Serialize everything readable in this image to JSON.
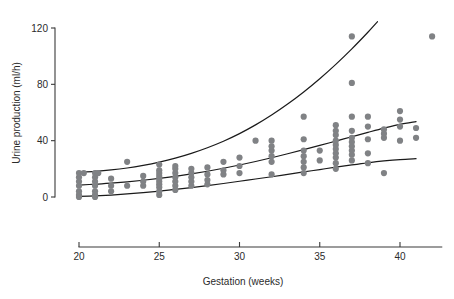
{
  "chart_data": {
    "type": "scatter",
    "title": "",
    "xlabel": "Gestation (weeks)",
    "ylabel": "Urine production (ml/h)",
    "xlim": [
      19.2,
      42.8
    ],
    "ylim": [
      -5,
      128
    ],
    "xticks": [
      20,
      25,
      30,
      35,
      40
    ],
    "xtick_labels": [
      "20",
      "25",
      "30",
      "35",
      "40"
    ],
    "yticks": [
      0,
      40,
      80,
      120
    ],
    "ytick_labels": [
      "0",
      "40",
      "80",
      "120"
    ],
    "grid": false,
    "legend": "none",
    "marker_color": "#808285",
    "curve_color": "#1a1a1a",
    "axis_color": "#3a3a3a",
    "series": [
      {
        "name": "Urine production measurements",
        "marker": "filled-circle",
        "points": [
          [
            20,
            0
          ],
          [
            20,
            1.5
          ],
          [
            20,
            4
          ],
          [
            20,
            8
          ],
          [
            20,
            11
          ],
          [
            20,
            14
          ],
          [
            20,
            17
          ],
          [
            20.3,
            17
          ],
          [
            21,
            0
          ],
          [
            21,
            1.5
          ],
          [
            21,
            4
          ],
          [
            21,
            8
          ],
          [
            21,
            11
          ],
          [
            21,
            14
          ],
          [
            21,
            17
          ],
          [
            21.2,
            17
          ],
          [
            22,
            4
          ],
          [
            22,
            8
          ],
          [
            22,
            13
          ],
          [
            23,
            8
          ],
          [
            23,
            25
          ],
          [
            24,
            8
          ],
          [
            24,
            11
          ],
          [
            24,
            15
          ],
          [
            25,
            1.5
          ],
          [
            25,
            4
          ],
          [
            25,
            7
          ],
          [
            25,
            9
          ],
          [
            25,
            11
          ],
          [
            25,
            13
          ],
          [
            25,
            15
          ],
          [
            25,
            17
          ],
          [
            25,
            19
          ],
          [
            25,
            23
          ],
          [
            26,
            5
          ],
          [
            26,
            8
          ],
          [
            26,
            11
          ],
          [
            26,
            14
          ],
          [
            26,
            17
          ],
          [
            26,
            20
          ],
          [
            26,
            22
          ],
          [
            27,
            8
          ],
          [
            27,
            11
          ],
          [
            27,
            14
          ],
          [
            27,
            17
          ],
          [
            27,
            20
          ],
          [
            28,
            9
          ],
          [
            28,
            12
          ],
          [
            28,
            16
          ],
          [
            28,
            21
          ],
          [
            29,
            16
          ],
          [
            29,
            19
          ],
          [
            29,
            25
          ],
          [
            30,
            17
          ],
          [
            30,
            22
          ],
          [
            30,
            28
          ],
          [
            31,
            40
          ],
          [
            32,
            16
          ],
          [
            32,
            25
          ],
          [
            32,
            29
          ],
          [
            32,
            33
          ],
          [
            32,
            36
          ],
          [
            32,
            40
          ],
          [
            34,
            17
          ],
          [
            34,
            21
          ],
          [
            34,
            25
          ],
          [
            34,
            29
          ],
          [
            34,
            33
          ],
          [
            34,
            41
          ],
          [
            34,
            57
          ],
          [
            35,
            26
          ],
          [
            35,
            33
          ],
          [
            36,
            20
          ],
          [
            36,
            24
          ],
          [
            36,
            28
          ],
          [
            36,
            31
          ],
          [
            36,
            34
          ],
          [
            36,
            37
          ],
          [
            36,
            40
          ],
          [
            36,
            44
          ],
          [
            36,
            47
          ],
          [
            36,
            51
          ],
          [
            37,
            26
          ],
          [
            37,
            30
          ],
          [
            37,
            33
          ],
          [
            37,
            36
          ],
          [
            37,
            39
          ],
          [
            37,
            42
          ],
          [
            37,
            47
          ],
          [
            37,
            57
          ],
          [
            37,
            81
          ],
          [
            37,
            114
          ],
          [
            38,
            24
          ],
          [
            38,
            31
          ],
          [
            38,
            41
          ],
          [
            38,
            50
          ],
          [
            38,
            57
          ],
          [
            39,
            17
          ],
          [
            39,
            42
          ],
          [
            39,
            45
          ],
          [
            39,
            48
          ],
          [
            40,
            40
          ],
          [
            40,
            50
          ],
          [
            40,
            55
          ],
          [
            40,
            61
          ],
          [
            41,
            42
          ],
          [
            41,
            49
          ],
          [
            42,
            114
          ]
        ]
      }
    ],
    "curves": [
      {
        "name": "upper-reference-curve",
        "points": [
          [
            20,
            17.5
          ],
          [
            21,
            18.2
          ],
          [
            22,
            19.2
          ],
          [
            23,
            20.6
          ],
          [
            24,
            22.5
          ],
          [
            25,
            24.8
          ],
          [
            26,
            27.6
          ],
          [
            27,
            31.0
          ],
          [
            28,
            35.0
          ],
          [
            29,
            39.6
          ],
          [
            30,
            45.0
          ],
          [
            31,
            51.2
          ],
          [
            32,
            58.2
          ],
          [
            33,
            66.0
          ],
          [
            34,
            74.6
          ],
          [
            35,
            84.0
          ],
          [
            36,
            94.2
          ],
          [
            37,
            105.2
          ],
          [
            38,
            117.0
          ],
          [
            38.6,
            124.5
          ]
        ]
      },
      {
        "name": "median-reference-curve",
        "points": [
          [
            20,
            8.5
          ],
          [
            21,
            9.1
          ],
          [
            22,
            9.9
          ],
          [
            23,
            10.8
          ],
          [
            24,
            11.9
          ],
          [
            25,
            13.2
          ],
          [
            26,
            14.7
          ],
          [
            27,
            16.4
          ],
          [
            28,
            18.3
          ],
          [
            29,
            20.4
          ],
          [
            30,
            22.7
          ],
          [
            31,
            25.2
          ],
          [
            32,
            27.9
          ],
          [
            33,
            30.7
          ],
          [
            34,
            33.6
          ],
          [
            35,
            36.6
          ],
          [
            36,
            39.7
          ],
          [
            37,
            42.8
          ],
          [
            38,
            45.9
          ],
          [
            39,
            48.9
          ],
          [
            40,
            51.6
          ],
          [
            41,
            53.5
          ]
        ]
      },
      {
        "name": "lower-reference-curve",
        "points": [
          [
            20,
            0.4
          ],
          [
            21,
            0.8
          ],
          [
            22,
            1.4
          ],
          [
            23,
            2.2
          ],
          [
            24,
            3.1
          ],
          [
            25,
            4.2
          ],
          [
            26,
            5.4
          ],
          [
            27,
            6.7
          ],
          [
            28,
            8.1
          ],
          [
            29,
            9.6
          ],
          [
            30,
            11.2
          ],
          [
            31,
            12.8
          ],
          [
            32,
            14.4
          ],
          [
            33,
            16.1
          ],
          [
            34,
            17.8
          ],
          [
            35,
            19.5
          ],
          [
            36,
            21.2
          ],
          [
            37,
            22.8
          ],
          [
            38,
            24.3
          ],
          [
            39,
            25.6
          ],
          [
            40,
            26.6
          ],
          [
            41,
            27.2
          ]
        ]
      }
    ]
  }
}
